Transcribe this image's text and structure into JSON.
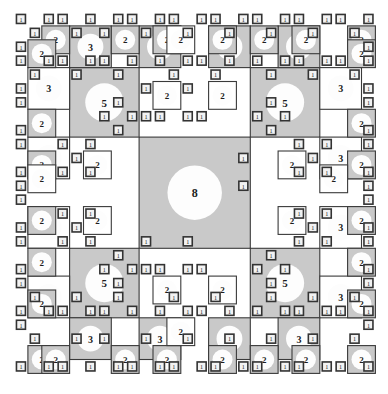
{
  "figure": {
    "width": 388,
    "height": 394,
    "background_color": "#ffffff",
    "gray_fill": "#c9c9c9",
    "white_fill": "#ffffff",
    "stroke_color": "#3a3a3a",
    "unit_box_fill": "#f2f2f2",
    "unit_box_stroke": "#333333",
    "disc_fill": "#fdfdfd",
    "label_color": "#1d1d1d",
    "caption": ""
  },
  "grid": {
    "origin_x": 14,
    "origin_y": 12,
    "unit": 13.9,
    "columns": 26,
    "rows": 26,
    "description": "26x26 base grid of unit cells; squares of size 1,2,3,5,8 units tile it"
  },
  "legend": {
    "values": [
      1,
      2,
      3,
      5,
      8
    ],
    "note": "Fibonacci-sized squares; each numeric label marks the side length in grid units"
  },
  "squares": [
    {
      "n": 8,
      "x": 9,
      "y": 9,
      "size": 8,
      "fill": "gray",
      "label": "8"
    },
    {
      "n": 5,
      "x": 4,
      "y": 4,
      "size": 5,
      "fill": "gray",
      "label": "5"
    },
    {
      "n": 5,
      "x": 17,
      "y": 4,
      "size": 5,
      "fill": "gray",
      "label": "5"
    },
    {
      "n": 5,
      "x": 4,
      "y": 17,
      "size": 5,
      "fill": "gray",
      "label": "5"
    },
    {
      "n": 5,
      "x": 17,
      "y": 17,
      "size": 5,
      "fill": "gray",
      "label": "5"
    },
    {
      "n": 3,
      "x": 4,
      "y": 1,
      "size": 3,
      "fill": "gray",
      "label": "3"
    },
    {
      "n": 3,
      "x": 9,
      "y": 1,
      "size": 3,
      "fill": "gray",
      "label": "3"
    },
    {
      "n": 3,
      "x": 14,
      "y": 1,
      "size": 3,
      "fill": "gray",
      "label": "3"
    },
    {
      "n": 3,
      "x": 19,
      "y": 1,
      "size": 3,
      "fill": "gray",
      "label": "3"
    },
    {
      "n": 3,
      "x": 1,
      "y": 4,
      "size": 3,
      "fill": "white",
      "label": "3"
    },
    {
      "n": 3,
      "x": 22,
      "y": 4,
      "size": 3,
      "fill": "white",
      "label": "3"
    },
    {
      "n": 3,
      "x": 1,
      "y": 9,
      "size": 3,
      "fill": "white",
      "label": "3"
    },
    {
      "n": 3,
      "x": 22,
      "y": 9,
      "size": 3,
      "fill": "white",
      "label": "3"
    },
    {
      "n": 3,
      "x": 1,
      "y": 14,
      "size": 3,
      "fill": "white",
      "label": "3"
    },
    {
      "n": 3,
      "x": 22,
      "y": 14,
      "size": 3,
      "fill": "white",
      "label": "3"
    },
    {
      "n": 3,
      "x": 1,
      "y": 19,
      "size": 3,
      "fill": "white",
      "label": "3"
    },
    {
      "n": 3,
      "x": 22,
      "y": 19,
      "size": 3,
      "fill": "white",
      "label": "3"
    },
    {
      "n": 3,
      "x": 4,
      "y": 22,
      "size": 3,
      "fill": "gray",
      "label": "3"
    },
    {
      "n": 3,
      "x": 9,
      "y": 22,
      "size": 3,
      "fill": "gray",
      "label": "3"
    },
    {
      "n": 3,
      "x": 14,
      "y": 22,
      "size": 3,
      "fill": "gray",
      "label": "3"
    },
    {
      "n": 3,
      "x": 19,
      "y": 22,
      "size": 3,
      "fill": "gray",
      "label": "3"
    },
    {
      "n": 2,
      "x": 2,
      "y": 1,
      "size": 2,
      "fill": "gray",
      "label": "2"
    },
    {
      "n": 2,
      "x": 7,
      "y": 1,
      "size": 2,
      "fill": "gray",
      "label": "2"
    },
    {
      "n": 2,
      "x": 10,
      "y": 1,
      "size": 2,
      "fill": "gray",
      "label": "2"
    },
    {
      "n": 2,
      "x": 14,
      "y": 1,
      "size": 2,
      "fill": "gray",
      "label": "2"
    },
    {
      "n": 2,
      "x": 17,
      "y": 1,
      "size": 2,
      "fill": "gray",
      "label": "2"
    },
    {
      "n": 2,
      "x": 20,
      "y": 1,
      "size": 2,
      "fill": "gray",
      "label": "2"
    },
    {
      "n": 2,
      "x": 24,
      "y": 1,
      "size": 2,
      "fill": "gray",
      "label": "2"
    },
    {
      "n": 2,
      "x": 1,
      "y": 2,
      "size": 2,
      "fill": "gray",
      "label": "2"
    },
    {
      "n": 2,
      "x": 1,
      "y": 7,
      "size": 2,
      "fill": "gray",
      "label": "2"
    },
    {
      "n": 2,
      "x": 1,
      "y": 10,
      "size": 2,
      "fill": "gray",
      "label": "2"
    },
    {
      "n": 2,
      "x": 1,
      "y": 14,
      "size": 2,
      "fill": "gray",
      "label": "2"
    },
    {
      "n": 2,
      "x": 1,
      "y": 17,
      "size": 2,
      "fill": "gray",
      "label": "2"
    },
    {
      "n": 2,
      "x": 1,
      "y": 20,
      "size": 2,
      "fill": "gray",
      "label": "2"
    },
    {
      "n": 2,
      "x": 1,
      "y": 24,
      "size": 2,
      "fill": "gray",
      "label": "2"
    },
    {
      "n": 2,
      "x": 24,
      "y": 2,
      "size": 2,
      "fill": "gray",
      "label": "2"
    },
    {
      "n": 2,
      "x": 24,
      "y": 7,
      "size": 2,
      "fill": "gray",
      "label": "2"
    },
    {
      "n": 2,
      "x": 24,
      "y": 10,
      "size": 2,
      "fill": "gray",
      "label": "2"
    },
    {
      "n": 2,
      "x": 24,
      "y": 14,
      "size": 2,
      "fill": "gray",
      "label": "2"
    },
    {
      "n": 2,
      "x": 24,
      "y": 17,
      "size": 2,
      "fill": "gray",
      "label": "2"
    },
    {
      "n": 2,
      "x": 24,
      "y": 20,
      "size": 2,
      "fill": "gray",
      "label": "2"
    },
    {
      "n": 2,
      "x": 24,
      "y": 24,
      "size": 2,
      "fill": "gray",
      "label": "2"
    },
    {
      "n": 2,
      "x": 2,
      "y": 24,
      "size": 2,
      "fill": "gray",
      "label": "2"
    },
    {
      "n": 2,
      "x": 7,
      "y": 24,
      "size": 2,
      "fill": "gray",
      "label": "2"
    },
    {
      "n": 2,
      "x": 10,
      "y": 24,
      "size": 2,
      "fill": "gray",
      "label": "2"
    },
    {
      "n": 2,
      "x": 14,
      "y": 24,
      "size": 2,
      "fill": "gray",
      "label": "2"
    },
    {
      "n": 2,
      "x": 17,
      "y": 24,
      "size": 2,
      "fill": "gray",
      "label": "2"
    },
    {
      "n": 2,
      "x": 20,
      "y": 24,
      "size": 2,
      "fill": "gray",
      "label": "2"
    },
    {
      "n": 2,
      "x": 10,
      "y": 5,
      "size": 2,
      "fill": "white",
      "label": "2"
    },
    {
      "n": 2,
      "x": 14,
      "y": 5,
      "size": 2,
      "fill": "white",
      "label": "2"
    },
    {
      "n": 2,
      "x": 5,
      "y": 10,
      "size": 2,
      "fill": "white",
      "label": "2"
    },
    {
      "n": 2,
      "x": 19,
      "y": 10,
      "size": 2,
      "fill": "white",
      "label": "2"
    },
    {
      "n": 2,
      "x": 5,
      "y": 14,
      "size": 2,
      "fill": "white",
      "label": "2"
    },
    {
      "n": 2,
      "x": 19,
      "y": 14,
      "size": 2,
      "fill": "white",
      "label": "2"
    },
    {
      "n": 2,
      "x": 10,
      "y": 19,
      "size": 2,
      "fill": "white",
      "label": "2"
    },
    {
      "n": 2,
      "x": 14,
      "y": 19,
      "size": 2,
      "fill": "white",
      "label": "2"
    },
    {
      "n": 2,
      "x": 1,
      "y": 11,
      "size": 2,
      "fill": "white",
      "label": "2"
    },
    {
      "n": 2,
      "x": 22,
      "y": 11,
      "size": 2,
      "fill": "white",
      "label": "2"
    },
    {
      "n": 2,
      "x": 11,
      "y": 1,
      "size": 2,
      "fill": "white",
      "label": "2"
    },
    {
      "n": 2,
      "x": 11,
      "y": 22,
      "size": 2,
      "fill": "white",
      "label": "2"
    }
  ],
  "unit_boxes": {
    "label": "1",
    "count": 168,
    "side": 9,
    "note": "Smallest Fibonacci squares, drawn as outlined boxes labelled 1"
  },
  "unit_positions": [
    [
      0,
      0
    ],
    [
      2,
      0
    ],
    [
      3,
      0
    ],
    [
      5,
      0
    ],
    [
      7,
      0
    ],
    [
      8,
      0
    ],
    [
      10,
      0
    ],
    [
      11,
      0
    ],
    [
      13,
      0
    ],
    [
      14,
      0
    ],
    [
      16,
      0
    ],
    [
      17,
      0
    ],
    [
      19,
      0
    ],
    [
      20,
      0
    ],
    [
      22,
      0
    ],
    [
      23,
      0
    ],
    [
      25,
      0
    ],
    [
      1,
      1
    ],
    [
      4,
      1
    ],
    [
      6,
      1
    ],
    [
      9,
      1
    ],
    [
      12,
      1
    ],
    [
      15,
      1
    ],
    [
      18,
      1
    ],
    [
      21,
      1
    ],
    [
      24,
      1
    ],
    [
      0,
      2
    ],
    [
      25,
      2
    ],
    [
      0,
      3
    ],
    [
      25,
      3
    ],
    [
      2,
      3
    ],
    [
      3,
      3
    ],
    [
      5,
      3
    ],
    [
      6,
      3
    ],
    [
      8,
      3
    ],
    [
      10,
      3
    ],
    [
      12,
      3
    ],
    [
      13,
      3
    ],
    [
      15,
      3
    ],
    [
      17,
      3
    ],
    [
      19,
      3
    ],
    [
      20,
      3
    ],
    [
      22,
      3
    ],
    [
      23,
      3
    ],
    [
      1,
      4
    ],
    [
      4,
      4
    ],
    [
      7,
      4
    ],
    [
      11,
      4
    ],
    [
      14,
      4
    ],
    [
      18,
      4
    ],
    [
      21,
      4
    ],
    [
      24,
      4
    ],
    [
      0,
      5
    ],
    [
      25,
      5
    ],
    [
      0,
      6
    ],
    [
      25,
      6
    ],
    [
      7,
      6
    ],
    [
      18,
      6
    ],
    [
      6,
      7
    ],
    [
      8,
      7
    ],
    [
      17,
      7
    ],
    [
      19,
      7
    ],
    [
      0,
      8
    ],
    [
      25,
      8
    ],
    [
      7,
      8
    ],
    [
      18,
      8
    ],
    [
      0,
      9
    ],
    [
      25,
      9
    ],
    [
      3,
      9
    ],
    [
      5,
      9
    ],
    [
      20,
      9
    ],
    [
      22,
      9
    ],
    [
      4,
      10
    ],
    [
      21,
      10
    ],
    [
      3,
      11
    ],
    [
      5,
      11
    ],
    [
      20,
      11
    ],
    [
      22,
      11
    ],
    [
      0,
      11
    ],
    [
      25,
      11
    ],
    [
      0,
      12
    ],
    [
      25,
      12
    ],
    [
      0,
      13
    ],
    [
      25,
      13
    ],
    [
      3,
      14
    ],
    [
      5,
      14
    ],
    [
      20,
      14
    ],
    [
      22,
      14
    ],
    [
      4,
      15
    ],
    [
      21,
      15
    ],
    [
      3,
      16
    ],
    [
      5,
      16
    ],
    [
      20,
      16
    ],
    [
      22,
      16
    ],
    [
      0,
      15
    ],
    [
      25,
      15
    ],
    [
      0,
      16
    ],
    [
      25,
      16
    ],
    [
      7,
      17
    ],
    [
      18,
      17
    ],
    [
      6,
      18
    ],
    [
      8,
      18
    ],
    [
      17,
      18
    ],
    [
      19,
      18
    ],
    [
      7,
      19
    ],
    [
      18,
      19
    ],
    [
      0,
      18
    ],
    [
      25,
      18
    ],
    [
      0,
      19
    ],
    [
      25,
      19
    ],
    [
      2,
      21
    ],
    [
      3,
      21
    ],
    [
      5,
      21
    ],
    [
      6,
      21
    ],
    [
      8,
      21
    ],
    [
      10,
      21
    ],
    [
      12,
      21
    ],
    [
      13,
      21
    ],
    [
      15,
      21
    ],
    [
      17,
      21
    ],
    [
      19,
      21
    ],
    [
      20,
      21
    ],
    [
      22,
      21
    ],
    [
      23,
      21
    ],
    [
      1,
      20
    ],
    [
      4,
      20
    ],
    [
      7,
      20
    ],
    [
      11,
      20
    ],
    [
      14,
      20
    ],
    [
      18,
      20
    ],
    [
      21,
      20
    ],
    [
      24,
      20
    ],
    [
      0,
      21
    ],
    [
      25,
      21
    ],
    [
      0,
      22
    ],
    [
      25,
      22
    ],
    [
      1,
      23
    ],
    [
      4,
      23
    ],
    [
      6,
      23
    ],
    [
      9,
      23
    ],
    [
      12,
      23
    ],
    [
      15,
      23
    ],
    [
      18,
      23
    ],
    [
      21,
      23
    ],
    [
      24,
      23
    ],
    [
      0,
      25
    ],
    [
      2,
      25
    ],
    [
      3,
      25
    ],
    [
      5,
      25
    ],
    [
      7,
      25
    ],
    [
      8,
      25
    ],
    [
      10,
      25
    ],
    [
      11,
      25
    ],
    [
      13,
      25
    ],
    [
      14,
      25
    ],
    [
      16,
      25
    ],
    [
      17,
      25
    ],
    [
      19,
      25
    ],
    [
      20,
      25
    ],
    [
      22,
      25
    ],
    [
      23,
      25
    ],
    [
      25,
      25
    ],
    [
      9,
      5
    ],
    [
      12,
      5
    ],
    [
      9,
      7
    ],
    [
      10,
      7
    ],
    [
      12,
      7
    ],
    [
      13,
      7
    ],
    [
      16,
      10
    ],
    [
      16,
      12
    ],
    [
      9,
      16
    ],
    [
      12,
      16
    ],
    [
      9,
      18
    ],
    [
      10,
      18
    ],
    [
      12,
      18
    ],
    [
      13,
      18
    ]
  ]
}
